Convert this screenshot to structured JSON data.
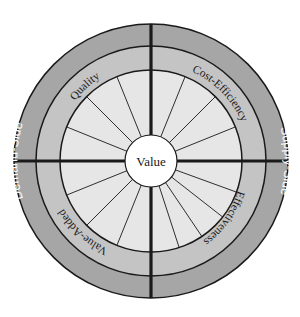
{
  "diagram": {
    "center_label": "Value",
    "outer_ring": {
      "left_label": "Demand-Side",
      "right_label": "Supply-Side"
    },
    "middle_ring": {
      "top_left_label": "Quality",
      "top_right_label": "Cost-Efficiency",
      "bottom_right_label": "Effectiveness",
      "bottom_left_label": "Value-Added"
    },
    "colors": {
      "outer_ring": "#a6a6a6",
      "middle_ring": "#c4c4c4",
      "inner_disc": "#e6e6e6",
      "center_circle": "#ffffff",
      "lines": "#1a1a1a",
      "outer_text": "#ffffff",
      "inner_text": "#1a1a1a"
    },
    "spoke_angles": {
      "top_right": [
        292,
        315,
        338
      ],
      "top_left": [
        202,
        225,
        248
      ],
      "bottom_left": [
        112,
        135,
        158
      ],
      "bottom_right": [
        20,
        38,
        56,
        72
      ]
    }
  }
}
